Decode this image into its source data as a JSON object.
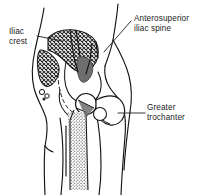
{
  "figure": {
    "background_color": "#ffffff",
    "line_color": "#141414",
    "text_color": "#1c1c1c",
    "sacrum_fill": "#6e6e6e",
    "hatch_fill": "#2a2a2a",
    "stipple_fill": "#3a3a3a"
  },
  "labels": {
    "iliac_crest": {
      "line1": "Iliac",
      "line2": "crest"
    },
    "anterosuperior_iliac_spine": {
      "line1": "Anterosuperior",
      "line2": "iliac spine"
    },
    "greater_trochanter": {
      "line1": "Greater",
      "line2": "trochanter"
    }
  },
  "structures": [
    {
      "name": "iliac-crest",
      "fill": "cross-hatch"
    },
    {
      "name": "anterosuperior-iliac-spine",
      "fill": "outline"
    },
    {
      "name": "greater-trochanter",
      "fill": "outline"
    },
    {
      "name": "sacrum",
      "fill": "solid-gray"
    },
    {
      "name": "femur-shaft",
      "fill": "stipple"
    },
    {
      "name": "femoral-head",
      "fill": "outline"
    },
    {
      "name": "body-contour",
      "fill": "none"
    }
  ]
}
